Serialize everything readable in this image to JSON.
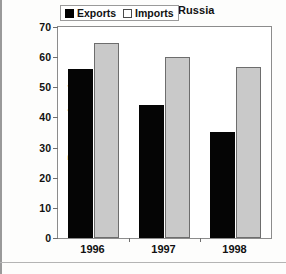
{
  "chart_data": {
    "type": "bar",
    "title": "Ukraine: Trade with Russia",
    "xlabel": "",
    "ylabel": "Percent of total.",
    "categories": [
      "1996",
      "1997",
      "1998"
    ],
    "series": [
      {
        "name": "Exports",
        "color": "#050505",
        "values": [
          56.2,
          44.1,
          35.2
        ]
      },
      {
        "name": "Imports",
        "color": "#c9c9c9",
        "values": [
          64.8,
          60.2,
          56.6
        ]
      }
    ],
    "ylim": [
      0,
      70
    ],
    "yticks": [
      0,
      10,
      20,
      30,
      40,
      50,
      60,
      70
    ],
    "ytick_labels": [
      "0",
      "10",
      "20",
      "30",
      "40",
      "50",
      "60",
      "70"
    ],
    "grid": false,
    "legend_position": "top-center"
  },
  "legend": {
    "items": [
      {
        "label": "Exports",
        "swatch": "black-square-icon"
      },
      {
        "label": "Imports",
        "swatch": "gray-square-icon"
      }
    ]
  }
}
